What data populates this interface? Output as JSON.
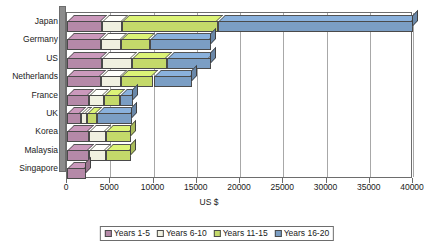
{
  "chart_data": {
    "type": "bar",
    "subtype": "stacked-horizontal-3d",
    "title": "",
    "xlabel": "US $",
    "ylabel": "",
    "xlim": [
      0,
      40000
    ],
    "xticks": [
      0,
      5000,
      10000,
      15000,
      20000,
      25000,
      30000,
      35000,
      40000
    ],
    "xticklabels": [
      "0",
      "5000",
      "10000",
      "15000",
      "20000",
      "25000",
      "30000",
      "35000",
      "40000"
    ],
    "grid": "vertical",
    "legend_position": "bottom",
    "categories": [
      "Japan",
      "Germany",
      "US",
      "Netherlands",
      "France",
      "UK",
      "Korea",
      "Malaysia",
      "Singapore"
    ],
    "series": [
      {
        "name": "Years 1-5",
        "color": "#b589a8",
        "values": [
          4000,
          3900,
          4000,
          3900,
          2600,
          1600,
          2500,
          2500,
          2200
        ]
      },
      {
        "name": "Years 6-10",
        "color": "#f0f0e0",
        "values": [
          2400,
          2400,
          3500,
          2400,
          1700,
          700,
          2000,
          2000,
          0
        ]
      },
      {
        "name": "Years 11-15",
        "color": "#c4d96a",
        "values": [
          11100,
          3300,
          4100,
          3700,
          1800,
          1200,
          2900,
          2900,
          0
        ]
      },
      {
        "name": "Years 16-20",
        "color": "#7b9ec4",
        "values": [
          22500,
          7000,
          5000,
          4400,
          1500,
          4000,
          0,
          0,
          0
        ]
      }
    ],
    "totals": [
      40000,
      16600,
      16600,
      14400,
      7600,
      7500,
      7400,
      7400,
      2200
    ]
  },
  "legend": {
    "items": [
      {
        "label": "Years 1-5",
        "color": "#b589a8"
      },
      {
        "label": "Years 6-10",
        "color": "#f0f0e0"
      },
      {
        "label": "Years 11-15",
        "color": "#c4d96a"
      },
      {
        "label": "Years 16-20",
        "color": "#7b9ec4"
      }
    ]
  },
  "axis": {
    "x_title": "US $"
  }
}
